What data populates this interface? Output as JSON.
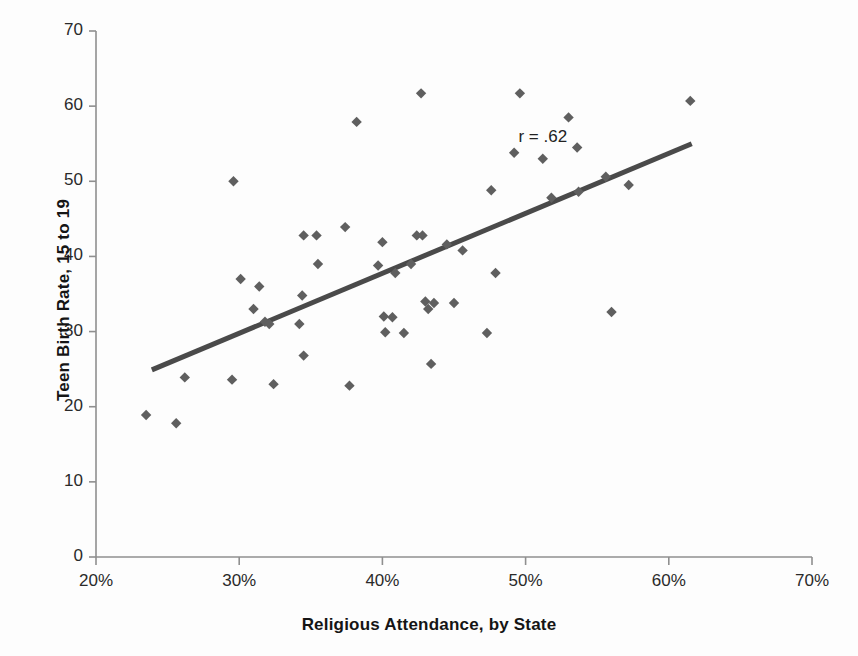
{
  "chart_data": {
    "type": "scatter",
    "title": "",
    "xlabel": "Religious Attendance, by State",
    "ylabel": "Teen Birth Rate, 15 to 19",
    "xlim": [
      20,
      70
    ],
    "ylim": [
      0,
      70
    ],
    "xticks": [
      "20%",
      "30%",
      "40%",
      "50%",
      "60%",
      "70%"
    ],
    "xtick_values": [
      20,
      30,
      40,
      50,
      60,
      70
    ],
    "yticks": [
      "0",
      "10",
      "20",
      "30",
      "40",
      "50",
      "60",
      "70"
    ],
    "ytick_values": [
      0,
      10,
      20,
      30,
      40,
      50,
      60,
      70
    ],
    "grid": false,
    "legend": false,
    "annotation": "r = .62",
    "annotation_x": 49.5,
    "annotation_y": 55.8,
    "marker": "diamond",
    "marker_color": "#5f5f5f",
    "trendline_color": "#4a4a4a",
    "axis_color": "#8f8f8f",
    "trendline": {
      "x_start": 23.9,
      "y_start": 24.9,
      "x_end": 61.6,
      "y_end": 55.0
    },
    "points": [
      {
        "x": 23.5,
        "y": 18.9
      },
      {
        "x": 25.6,
        "y": 17.8
      },
      {
        "x": 26.2,
        "y": 23.9
      },
      {
        "x": 29.5,
        "y": 23.6
      },
      {
        "x": 29.6,
        "y": 50.0
      },
      {
        "x": 30.1,
        "y": 37.0
      },
      {
        "x": 31.0,
        "y": 33.0
      },
      {
        "x": 31.4,
        "y": 36.0
      },
      {
        "x": 31.8,
        "y": 31.3
      },
      {
        "x": 32.1,
        "y": 31.0
      },
      {
        "x": 32.4,
        "y": 23.0
      },
      {
        "x": 34.2,
        "y": 31.0
      },
      {
        "x": 34.4,
        "y": 34.8
      },
      {
        "x": 34.5,
        "y": 42.8
      },
      {
        "x": 34.5,
        "y": 26.8
      },
      {
        "x": 35.4,
        "y": 42.8
      },
      {
        "x": 35.5,
        "y": 39.0
      },
      {
        "x": 37.4,
        "y": 43.9
      },
      {
        "x": 37.7,
        "y": 22.8
      },
      {
        "x": 38.2,
        "y": 57.9
      },
      {
        "x": 39.7,
        "y": 38.8
      },
      {
        "x": 40.0,
        "y": 41.9
      },
      {
        "x": 40.1,
        "y": 32.0
      },
      {
        "x": 40.2,
        "y": 29.9
      },
      {
        "x": 40.7,
        "y": 31.9
      },
      {
        "x": 40.9,
        "y": 37.8
      },
      {
        "x": 41.5,
        "y": 29.8
      },
      {
        "x": 42.0,
        "y": 39.0
      },
      {
        "x": 42.4,
        "y": 42.8
      },
      {
        "x": 42.7,
        "y": 61.7
      },
      {
        "x": 42.8,
        "y": 42.8
      },
      {
        "x": 43.0,
        "y": 34.0
      },
      {
        "x": 43.2,
        "y": 33.0
      },
      {
        "x": 43.4,
        "y": 25.7
      },
      {
        "x": 43.6,
        "y": 33.8
      },
      {
        "x": 44.5,
        "y": 41.6
      },
      {
        "x": 45.0,
        "y": 33.8
      },
      {
        "x": 45.6,
        "y": 40.8
      },
      {
        "x": 47.3,
        "y": 29.8
      },
      {
        "x": 47.6,
        "y": 48.8
      },
      {
        "x": 47.9,
        "y": 37.8
      },
      {
        "x": 49.2,
        "y": 53.8
      },
      {
        "x": 49.6,
        "y": 61.7
      },
      {
        "x": 51.2,
        "y": 53.0
      },
      {
        "x": 51.8,
        "y": 47.8
      },
      {
        "x": 53.0,
        "y": 58.5
      },
      {
        "x": 53.6,
        "y": 54.5
      },
      {
        "x": 53.7,
        "y": 48.6
      },
      {
        "x": 55.6,
        "y": 50.6
      },
      {
        "x": 56.0,
        "y": 32.6
      },
      {
        "x": 57.2,
        "y": 49.5
      },
      {
        "x": 61.5,
        "y": 60.7
      }
    ]
  }
}
